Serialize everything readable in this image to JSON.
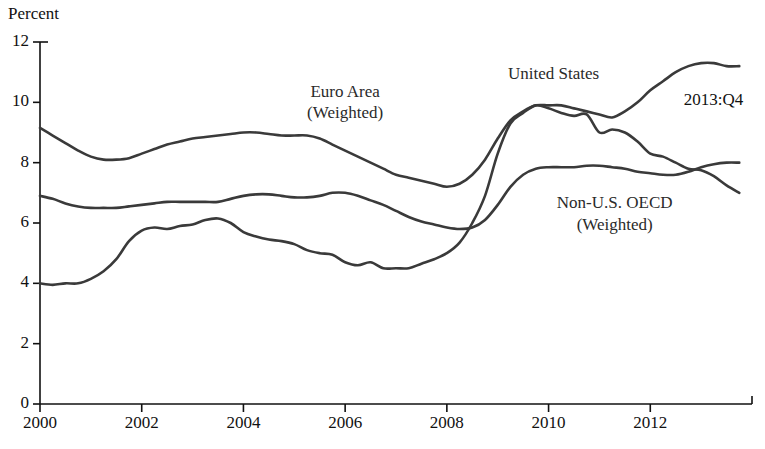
{
  "chart_data": {
    "type": "line",
    "title": "",
    "ylabel": "Percent",
    "xlabel": "",
    "ylim": [
      0,
      12
    ],
    "xlim": [
      2000,
      2014
    ],
    "ytick_labels": [
      "0",
      "2",
      "4",
      "6",
      "8",
      "10",
      "12"
    ],
    "ytick_values": [
      0,
      2,
      4,
      6,
      8,
      10,
      12
    ],
    "xtick_labels": [
      "2000",
      "2002",
      "2004",
      "2006",
      "2008",
      "2010",
      "2012"
    ],
    "xtick_values": [
      2000,
      2002,
      2004,
      2006,
      2008,
      2010,
      2012
    ],
    "grid": false,
    "legend": "inline-annotations",
    "line_color": "#3a3a3a",
    "annotations": [
      {
        "name": "euro-area-label",
        "lines": [
          "Euro Area",
          "(Weighted)"
        ],
        "x": 2006.0,
        "y": 10.35
      },
      {
        "name": "united-states-label",
        "lines": [
          "United States"
        ],
        "x": 2010.1,
        "y": 10.95
      },
      {
        "name": "non-us-oecd-label",
        "lines": [
          "Non-U.S. OECD",
          "(Weighted)"
        ],
        "x": 2011.3,
        "y": 6.65
      },
      {
        "name": "endpoint-label",
        "lines": [
          "2013:Q4"
        ],
        "x": 2013.6,
        "y": 10.05
      }
    ],
    "series": [
      {
        "name": "Euro Area (Weighted)",
        "x": [
          2000.0,
          2000.25,
          2000.5,
          2000.75,
          2001.0,
          2001.25,
          2001.5,
          2001.75,
          2002.0,
          2002.25,
          2002.5,
          2002.75,
          2003.0,
          2003.25,
          2003.5,
          2003.75,
          2004.0,
          2004.25,
          2004.5,
          2004.75,
          2005.0,
          2005.25,
          2005.5,
          2005.75,
          2006.0,
          2006.25,
          2006.5,
          2006.75,
          2007.0,
          2007.25,
          2007.5,
          2007.75,
          2008.0,
          2008.25,
          2008.5,
          2008.75,
          2009.0,
          2009.25,
          2009.5,
          2009.75,
          2010.0,
          2010.25,
          2010.5,
          2010.75,
          2011.0,
          2011.25,
          2011.5,
          2011.75,
          2012.0,
          2012.25,
          2012.5,
          2012.75,
          2013.0,
          2013.25,
          2013.5,
          2013.75
        ],
        "values": [
          9.15,
          8.9,
          8.65,
          8.4,
          8.2,
          8.1,
          8.1,
          8.15,
          8.3,
          8.45,
          8.6,
          8.7,
          8.8,
          8.85,
          8.9,
          8.95,
          9.0,
          9.0,
          8.95,
          8.9,
          8.9,
          8.9,
          8.8,
          8.6,
          8.4,
          8.2,
          8.0,
          7.8,
          7.6,
          7.5,
          7.4,
          7.3,
          7.2,
          7.3,
          7.6,
          8.1,
          8.8,
          9.4,
          9.7,
          9.9,
          9.9,
          9.9,
          9.8,
          9.7,
          9.6,
          9.5,
          9.7,
          10.0,
          10.4,
          10.7,
          11.0,
          11.2,
          11.3,
          11.3,
          11.2,
          11.2
        ]
      },
      {
        "name": "Non-U.S. OECD (Weighted)",
        "x": [
          2000.0,
          2000.25,
          2000.5,
          2000.75,
          2001.0,
          2001.25,
          2001.5,
          2001.75,
          2002.0,
          2002.25,
          2002.5,
          2002.75,
          2003.0,
          2003.25,
          2003.5,
          2003.75,
          2004.0,
          2004.25,
          2004.5,
          2004.75,
          2005.0,
          2005.25,
          2005.5,
          2005.75,
          2006.0,
          2006.25,
          2006.5,
          2006.75,
          2007.0,
          2007.25,
          2007.5,
          2007.75,
          2008.0,
          2008.25,
          2008.5,
          2008.75,
          2009.0,
          2009.25,
          2009.5,
          2009.75,
          2010.0,
          2010.25,
          2010.5,
          2010.75,
          2011.0,
          2011.25,
          2011.5,
          2011.75,
          2012.0,
          2012.25,
          2012.5,
          2012.75,
          2013.0,
          2013.25,
          2013.5,
          2013.75
        ],
        "values": [
          6.9,
          6.8,
          6.65,
          6.55,
          6.5,
          6.5,
          6.5,
          6.55,
          6.6,
          6.65,
          6.7,
          6.7,
          6.7,
          6.7,
          6.7,
          6.8,
          6.9,
          6.95,
          6.95,
          6.9,
          6.85,
          6.85,
          6.9,
          7.0,
          7.0,
          6.9,
          6.75,
          6.6,
          6.4,
          6.2,
          6.05,
          5.95,
          5.85,
          5.8,
          5.85,
          6.1,
          6.6,
          7.2,
          7.6,
          7.8,
          7.85,
          7.85,
          7.85,
          7.9,
          7.9,
          7.85,
          7.8,
          7.7,
          7.65,
          7.6,
          7.6,
          7.7,
          7.85,
          7.95,
          8.0,
          8.0
        ]
      },
      {
        "name": "United States",
        "x": [
          2000.0,
          2000.25,
          2000.5,
          2000.75,
          2001.0,
          2001.25,
          2001.5,
          2001.75,
          2002.0,
          2002.25,
          2002.5,
          2002.75,
          2003.0,
          2003.25,
          2003.5,
          2003.75,
          2004.0,
          2004.25,
          2004.5,
          2004.75,
          2005.0,
          2005.25,
          2005.5,
          2005.75,
          2006.0,
          2006.25,
          2006.5,
          2006.75,
          2007.0,
          2007.25,
          2007.5,
          2007.75,
          2008.0,
          2008.25,
          2008.5,
          2008.75,
          2009.0,
          2009.25,
          2009.5,
          2009.75,
          2010.0,
          2010.25,
          2010.5,
          2010.75,
          2011.0,
          2011.25,
          2011.5,
          2011.75,
          2012.0,
          2012.25,
          2012.5,
          2012.75,
          2013.0,
          2013.25,
          2013.5,
          2013.75
        ],
        "values": [
          4.0,
          3.95,
          4.0,
          4.0,
          4.15,
          4.4,
          4.8,
          5.4,
          5.75,
          5.85,
          5.8,
          5.9,
          5.95,
          6.1,
          6.15,
          6.0,
          5.7,
          5.55,
          5.45,
          5.4,
          5.3,
          5.1,
          5.0,
          4.95,
          4.7,
          4.6,
          4.7,
          4.5,
          4.5,
          4.5,
          4.65,
          4.8,
          5.0,
          5.35,
          6.0,
          6.9,
          8.3,
          9.3,
          9.65,
          9.9,
          9.8,
          9.65,
          9.55,
          9.6,
          9.0,
          9.1,
          9.0,
          8.7,
          8.3,
          8.2,
          8.0,
          7.8,
          7.75,
          7.55,
          7.25,
          7.0
        ]
      }
    ]
  },
  "source_note": ""
}
